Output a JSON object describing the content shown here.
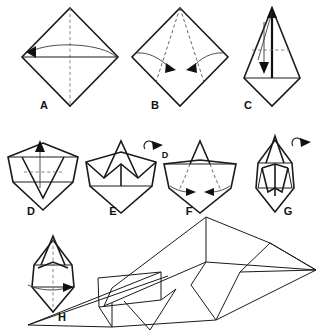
{
  "document": {
    "kind": "origami-instruction-diagram",
    "subject": "Paper airplane (dart) folding sequence",
    "background_color": "#ffffff",
    "line_color": "#1a1a1a",
    "fold_line_color": "#7a7a7a",
    "width": 318,
    "height": 330
  },
  "steps": [
    {
      "id": "A",
      "label": "A",
      "label_x": 44,
      "label_y": 106,
      "shape": "square-diamond",
      "center_x": 70,
      "center_y": 55,
      "half_width": 48,
      "half_height": 48,
      "has_vertical_dashed_crease": true,
      "has_horizontal_edge": true,
      "arrow": "curved-arrow-left",
      "arrowhead": "solid-triangle"
    },
    {
      "id": "B",
      "label": "B",
      "label_x": 155,
      "label_y": 106,
      "shape": "square-diamond",
      "center_x": 180,
      "center_y": 55,
      "half_width": 48,
      "half_height": 48,
      "has_two_diagonal_dashed_creases": true,
      "arrows": "two-curved-arrows-inward",
      "arrowhead": "solid-triangle"
    },
    {
      "id": "C",
      "label": "C",
      "label_x": 248,
      "label_y": 106,
      "shape": "kite",
      "center_x": 272,
      "center_y": 55,
      "has_vertical_bold_line": true,
      "has_horizontal_dashed_crease": true,
      "arrow_up": true,
      "arrow_down": true,
      "arrowhead": "solid-triangle"
    },
    {
      "id": "D",
      "label": "D",
      "label_x": 31,
      "label_y": 212,
      "shape": "pentagon-with-inner-vee",
      "center_x": 43,
      "center_y": 168,
      "has_horizontal_dashed_crease": true,
      "arrow": "arrow-up",
      "arrowhead": "solid-triangle"
    },
    {
      "id": "E",
      "label": "E",
      "label_x": 113,
      "label_y": 212,
      "shape": "pentagon-with-raised-peak",
      "center_x": 121,
      "center_y": 168,
      "flip_symbol": true,
      "flip_symbol_label": "turn-over"
    },
    {
      "id": "F",
      "label": "F",
      "label_x": 189,
      "label_y": 212,
      "shape": "pentagon-with-small-peak",
      "center_x": 200,
      "center_y": 168,
      "has_two_curved_dashed_creases": true,
      "arrows": "two-arrows-inward",
      "arrowhead": "solid-triangle"
    },
    {
      "id": "G",
      "label": "G",
      "label_x": 288,
      "label_y": 212,
      "shape": "narrow-folded-dart",
      "center_x": 275,
      "center_y": 168,
      "flip_symbol": true,
      "flip_symbol_label": "turn-over"
    },
    {
      "id": "H",
      "label": "H",
      "label_x": 62,
      "label_y": 318,
      "shape": "narrow-dart-front-view",
      "center_x": 53,
      "center_y": 272,
      "has_vertical_dashed_crease": true,
      "arrow": "arrow-right",
      "arrowhead": "solid-triangle"
    }
  ],
  "final_model": {
    "name": "finished-paper-airplane",
    "view": "three-quarter perspective",
    "center_x": 212,
    "center_y": 275,
    "description": "Completed paper dart seen from the side, nose pointing lower-left, wings swept back with visible fold panels"
  },
  "flip_symbols": [
    {
      "for_step": "E",
      "x": 149,
      "y": 145,
      "extra_label": "D"
    },
    {
      "for_step": "G",
      "x": 293,
      "y": 140,
      "extra_label": ""
    }
  ]
}
